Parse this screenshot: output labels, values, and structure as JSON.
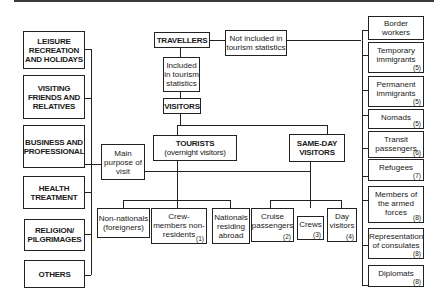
{
  "diagram": {
    "center": {
      "travellers": "TRAVELLERS",
      "not_included": "Not included in tourism statistics",
      "included": "Included in tourism statistics",
      "visitors": "VISITORS",
      "tourists": "TOURISTS",
      "tourists_sub": "(overnight visitors)",
      "same_day": "SAME-DAY VISITORS",
      "main_purpose": "Main purpose of visit"
    },
    "tourist_types": [
      {
        "label": "Non-nationals (foreigners)",
        "note": ""
      },
      {
        "label": "Crew-members non-residents",
        "note": "(1)"
      },
      {
        "label": "Nationals residing abroad",
        "note": ""
      }
    ],
    "same_day_types": [
      {
        "label": "Cruise passengers",
        "note": "(2)"
      },
      {
        "label": "Crews",
        "note": "(3)"
      },
      {
        "label": "Day visitors",
        "note": "(4)"
      }
    ],
    "purposes": [
      "LEISURE RECREATION AND HOLIDAYS",
      "VISITING FRIENDS AND RELATIVES",
      "BUSINESS AND PROFESSIONAL",
      "HEALTH TREATMENT",
      "RELIGION/ PILGRIMAGES",
      "OTHERS"
    ],
    "excluded": [
      {
        "label": "Border workers",
        "note": ""
      },
      {
        "label": "Temporary immigrants",
        "note": "(5)"
      },
      {
        "label": "Permanent immigrants",
        "note": "(5)"
      },
      {
        "label": "Nomads",
        "note": "(5)"
      },
      {
        "label": "Transit passengers",
        "note": "(6)"
      },
      {
        "label": "Refugees",
        "note": "(7)"
      },
      {
        "label": "Members of the armed forces",
        "note": "(8)"
      },
      {
        "label": "Representation of consulates",
        "note": "(8)"
      },
      {
        "label": "Diplomats",
        "note": "(8)"
      }
    ]
  }
}
